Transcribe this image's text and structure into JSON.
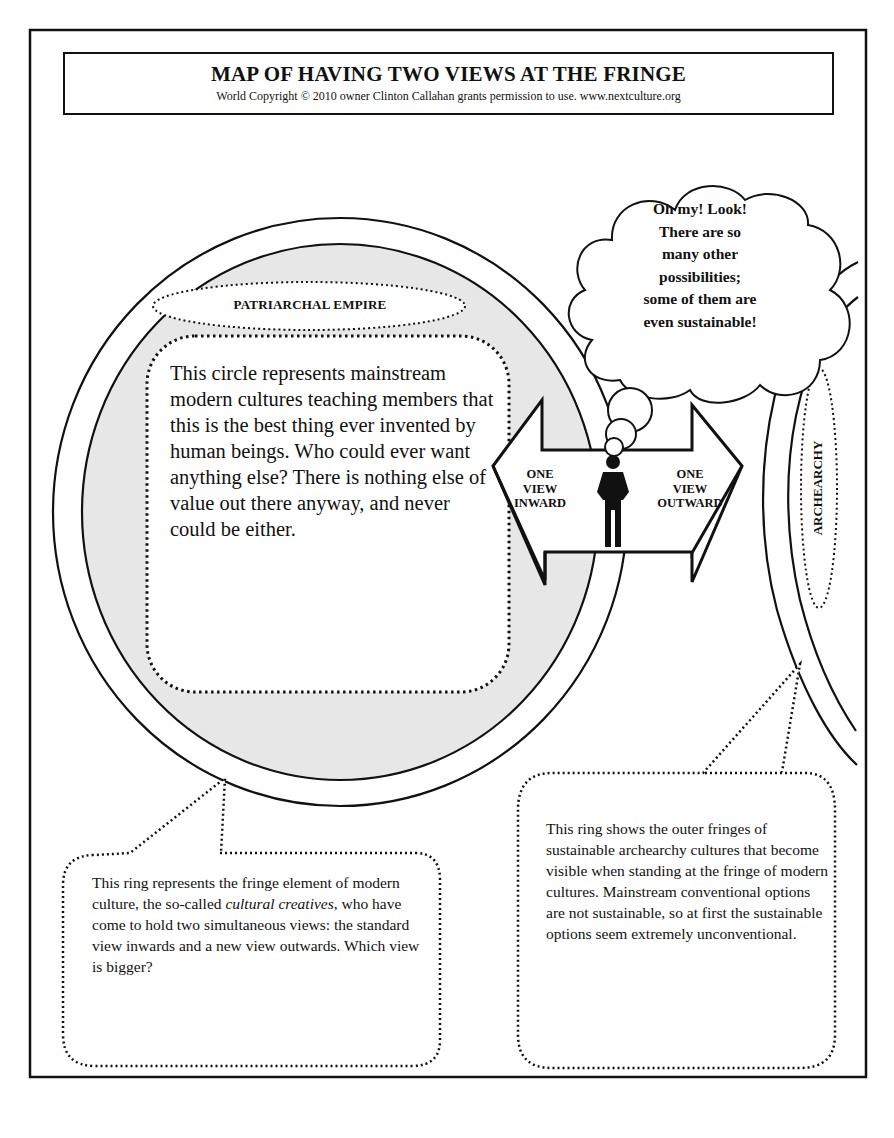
{
  "header": {
    "title": "MAP OF HAVING TWO VIEWS AT THE FRINGE",
    "copyright": "World Copyright © 2010 owner Clinton Callahan grants permission to use. www.nextculture.org"
  },
  "inner_circle": {
    "label": "PATRIARCHAL EMPIRE",
    "description": "This circle represents mainstream modern cultures teaching members that this is the best thing ever invented by human beings. Who could ever want anything else? There is nothing else of value out there anyway, and never could be either."
  },
  "thought_cloud": {
    "lines": [
      "Oh my! Look!",
      "There are so",
      "many other",
      "possibilities;",
      "some of them are",
      "even sustainable!"
    ]
  },
  "arrow": {
    "left_label_lines": [
      "ONE",
      "VIEW",
      "INWARD"
    ],
    "right_label_lines": [
      "ONE",
      "VIEW",
      "OUTWARD"
    ],
    "figure_icon": "standing-person-icon"
  },
  "outer_ring": {
    "label": "ARCHEARCHY"
  },
  "callouts": {
    "left": {
      "text_before": "This ring represents the fringe element of modern culture, the so-called ",
      "text_italic": "cultural creatives",
      "text_after": ", who have come to hold two simultaneous views: the standard view inwards and a new view outwards. Which view is bigger?"
    },
    "right": {
      "text": "This ring shows the outer fringes of sustainable archearchy cultures that become visible when standing at the fringe of modern cultures. Mainstream conventional options are not sustainable, so at first the sustainable options seem extremely unconventional."
    }
  },
  "colors": {
    "ink": "#111111",
    "inner_fill": "#e7e7e7",
    "background": "#ffffff"
  }
}
